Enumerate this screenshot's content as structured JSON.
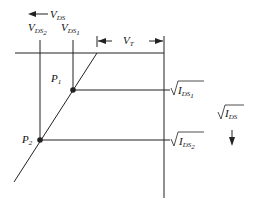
{
  "diagram": {
    "colors": {
      "line": "#222222",
      "background": "#ffffff"
    },
    "labels": {
      "vds_axis": {
        "base": "V",
        "sub": "DS"
      },
      "vds2": {
        "base": "V",
        "sub": "DS",
        "subsub": "2"
      },
      "vds1": {
        "base": "V",
        "sub": "DS",
        "subsub": "1"
      },
      "vt": {
        "base": "V",
        "sub": "T"
      },
      "p1": {
        "base": "P",
        "sub": "1"
      },
      "p2": {
        "base": "P",
        "sub": "2"
      },
      "ids1": {
        "base": "I",
        "sub": "DS",
        "subsub": "1"
      },
      "ids2": {
        "base": "I",
        "sub": "DS",
        "subsub": "2"
      },
      "ids_axis": {
        "base": "I",
        "sub": "DS"
      }
    },
    "points": [
      {
        "name": "P1",
        "x": 73,
        "y": 90
      },
      {
        "name": "P2",
        "x": 40,
        "y": 140
      }
    ]
  }
}
